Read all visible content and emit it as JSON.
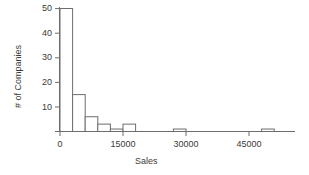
{
  "chart_data": {
    "type": "bar",
    "title": "",
    "subtitle": "",
    "xlabel": "Sales",
    "ylabel": "# of Companies",
    "xlim": [
      -2000,
      53000
    ],
    "ylim": [
      0,
      52
    ],
    "grid": false,
    "legend": null,
    "bin_width": 3000,
    "xticks": [
      0,
      15000,
      30000,
      45000
    ],
    "xticklabels": [
      "0",
      "15000",
      "30000",
      "45000"
    ],
    "yticks": [
      10,
      20,
      30,
      40,
      50
    ],
    "yticklabels": [
      "10",
      "20",
      "30",
      "40",
      "50"
    ],
    "bars": [
      {
        "x0": 0,
        "x1": 3000,
        "value": 50
      },
      {
        "x0": 3000,
        "x1": 6000,
        "value": 15
      },
      {
        "x0": 6000,
        "x1": 9000,
        "value": 6
      },
      {
        "x0": 9000,
        "x1": 12000,
        "value": 3
      },
      {
        "x0": 12000,
        "x1": 15000,
        "value": 1
      },
      {
        "x0": 15000,
        "x1": 18000,
        "value": 3
      },
      {
        "x0": 27000,
        "x1": 30000,
        "value": 1
      },
      {
        "x0": 48000,
        "x1": 51000,
        "value": 1
      }
    ],
    "categories": [
      "0-3000",
      "3000-6000",
      "6000-9000",
      "9000-12000",
      "12000-15000",
      "15000-18000",
      "27000-30000",
      "48000-51000"
    ],
    "values": [
      50,
      15,
      6,
      3,
      1,
      3,
      1,
      1
    ],
    "colors": {
      "bar_edge": "#6d6d6d",
      "bar_fill": "#ffffff",
      "axis": "#6d6d6d",
      "text": "#3a3a3a",
      "background": "#ffffff"
    }
  }
}
